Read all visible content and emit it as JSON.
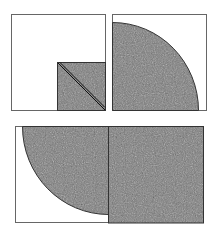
{
  "figure": {
    "colors": {
      "background": "#ffffff",
      "outline": "#333333",
      "frame": "#666666",
      "texture_base": "#7a7a7a",
      "texture_light": "#a8a8a8",
      "texture_dark": "#4e4e4e"
    },
    "panels": [
      {
        "id": "top-left",
        "shape": "square with shaded lower-right sub-square and diagonal"
      },
      {
        "id": "top-right",
        "shape": "square with shaded quarter circle"
      },
      {
        "id": "bottom",
        "shape": "rectangle with shaded quarter circle and adjacent shaded square"
      }
    ]
  }
}
